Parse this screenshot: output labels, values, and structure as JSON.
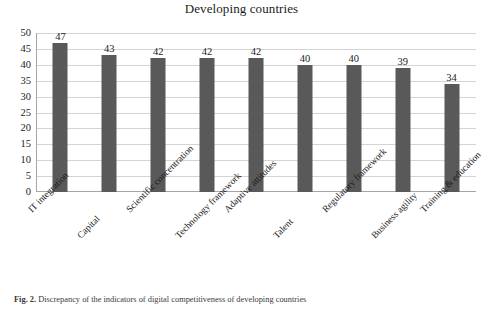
{
  "chart_data": {
    "type": "bar",
    "title": "Developing countries",
    "xlabel": "",
    "ylabel": "",
    "ylim": [
      0,
      50
    ],
    "ytick_step": 5,
    "yticks": [
      50,
      45,
      40,
      35,
      30,
      25,
      20,
      15,
      10,
      5,
      0
    ],
    "grid": true,
    "legend": "none",
    "bar_color": "#595959",
    "gridline_color": "#d4d4d4",
    "axis_color": "#a6a6a6",
    "categories": [
      "IT integration",
      "Capital",
      "Scientific concentration",
      "Technology framework",
      "Adaptive attitudes",
      "Talent",
      "Regulatory framework",
      "Business agility",
      "Training & education"
    ],
    "values": [
      47,
      43,
      42,
      42,
      42,
      40,
      40,
      39,
      34
    ],
    "data_labels": [
      "47",
      "43",
      "42",
      "42",
      "42",
      "40",
      "40",
      "39",
      "34"
    ]
  },
  "caption": {
    "figure_number": "Fig. 2.",
    "text": "Discrepancy of the indicators of digital competitiveness of developing countries"
  }
}
